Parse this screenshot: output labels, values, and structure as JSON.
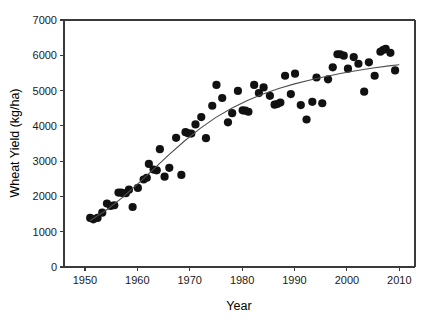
{
  "chart_data": {
    "type": "scatter",
    "title": "",
    "xlabel": "Year",
    "ylabel": "Wheat Yield (kg/ha)",
    "xlim": [
      1946,
      2013
    ],
    "ylim": [
      0,
      7000
    ],
    "grid": false,
    "legend": null,
    "xticks": [
      1950,
      1960,
      1970,
      1980,
      1990,
      2000,
      2010
    ],
    "xtick_labels": [
      "1950",
      "1960",
      "1970",
      "1980",
      "1990",
      "2000",
      "2010"
    ],
    "yticks": [
      0,
      1000,
      2000,
      3000,
      4000,
      5000,
      6000,
      7000
    ],
    "ytick_labels": [
      "0",
      "1000",
      "2000",
      "3000",
      "4000",
      "5000",
      "6000",
      "7000"
    ],
    "marker": {
      "shape": "circle",
      "color": "#111111",
      "size": 5
    },
    "series": [
      {
        "name": "Wheat Yield",
        "x": [
          1951,
          1951.6,
          1952.4,
          1953.3,
          1954.2,
          1954.9,
          1955.6,
          1956.4,
          1956.9,
          1957.3,
          1957.8,
          1958.4,
          1959.1,
          1960.1,
          1961.2,
          1961.8,
          1962.2,
          1963.1,
          1963.7,
          1964.3,
          1965.2,
          1966.1,
          1967.4,
          1968.4,
          1969.2,
          1969.7,
          1970.3,
          1971.1,
          1972.2,
          1973.1,
          1974.3,
          1975.1,
          1976.2,
          1977.3,
          1978.1,
          1979.2,
          1980.1,
          1980.6,
          1981.2,
          1982.3,
          1983.2,
          1984.1,
          1985.3,
          1986.2,
          1986.7,
          1987.3,
          1988.2,
          1989.3,
          1990.1,
          1991.2,
          1992.3,
          1993.4,
          1994.2,
          1995.3,
          1996.4,
          1997.3,
          1998.2,
          1998.7,
          1999.4,
          2000.2,
          2001.3,
          2002.2,
          2003.3,
          2004.2,
          2005.3,
          2006.4,
          2006.9,
          2007.4,
          2008.3,
          2009.2
        ],
        "y": [
          1390,
          1350,
          1390,
          1540,
          1800,
          1730,
          1750,
          2110,
          2110,
          2090,
          2090,
          2190,
          1700,
          2240,
          2480,
          2530,
          2920,
          2760,
          2740,
          3340,
          2560,
          2810,
          3660,
          2610,
          3820,
          3790,
          3780,
          4040,
          4250,
          3650,
          4570,
          5160,
          4790,
          4100,
          4360,
          4990,
          4440,
          4430,
          4400,
          5160,
          4930,
          5090,
          4850,
          4600,
          4620,
          4660,
          5420,
          4900,
          5480,
          4590,
          4180,
          4680,
          5370,
          4640,
          5320,
          5660,
          6030,
          6030,
          5990,
          5620,
          5950,
          5760,
          4970,
          5800,
          5420,
          6100,
          6150,
          6180,
          6070,
          5570
        ]
      }
    ],
    "trendline": {
      "name": "fitted sigmoidal curve",
      "color": "#4d4d4d",
      "x": [
        1951,
        1954,
        1957,
        1960,
        1963,
        1966,
        1969,
        1972,
        1975,
        1978,
        1981,
        1984,
        1987,
        1990,
        1993,
        1996,
        1999,
        2002,
        2005,
        2008,
        2010
      ],
      "y": [
        1320,
        1600,
        1950,
        2340,
        2760,
        3180,
        3570,
        3930,
        4240,
        4500,
        4720,
        4900,
        5060,
        5190,
        5300,
        5400,
        5490,
        5570,
        5640,
        5700,
        5730
      ]
    }
  },
  "axes": {
    "x_title": "Year",
    "y_title": "Wheat Yield (kg/ha)"
  }
}
